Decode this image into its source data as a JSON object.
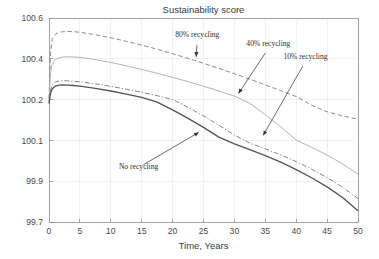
{
  "chart_data": {
    "type": "line",
    "title": "Sustainability score",
    "xlabel": "Time, Years",
    "ylabel": "",
    "grid": true,
    "legend_position": "inline-annotations",
    "xlim": [
      0,
      50
    ],
    "xticks": [
      0,
      5,
      10,
      15,
      20,
      25,
      30,
      35,
      40,
      45,
      50
    ],
    "xticklabels": [
      "0",
      "5",
      "10",
      "15",
      "20",
      "25",
      "30",
      "35",
      "40",
      "45",
      "50"
    ],
    "yticklabels": [
      "100.6",
      "100.4",
      "100.2",
      "100.1",
      "99.9",
      "99.7"
    ],
    "yticks": [
      100.6,
      100.4,
      100.2,
      100.1,
      99.9,
      99.7
    ],
    "y_axis_note": "tick labels are drawn at evenly spaced positions though the numeric gaps are uneven (0.2,0.2,0.1,0.2,0.2)",
    "x": [
      0,
      0.25,
      0.5,
      1,
      1.5,
      2,
      3,
      4,
      5,
      7.5,
      10,
      12.5,
      15,
      17.5,
      20,
      22.5,
      25,
      27.5,
      30,
      32.5,
      35,
      37.5,
      40,
      42.5,
      45,
      47.5,
      50
    ],
    "series": [
      {
        "name": "80% recycling",
        "style": "dashed",
        "color": "#8d8d8d",
        "width": 1.0,
        "values": [
          100.205,
          100.43,
          100.495,
          100.52,
          100.528,
          100.532,
          100.534,
          100.533,
          100.53,
          100.518,
          100.503,
          100.486,
          100.467,
          100.447,
          100.425,
          100.402,
          100.378,
          100.353,
          100.327,
          100.3,
          100.272,
          100.244,
          100.215,
          100.186,
          100.17,
          100.16,
          100.152
        ]
      },
      {
        "name": "40% recycling",
        "style": "solid",
        "color": "#b4b4b4",
        "width": 1.0,
        "values": [
          100.2,
          100.33,
          100.372,
          100.396,
          100.404,
          100.408,
          100.41,
          100.409,
          100.407,
          100.396,
          100.382,
          100.366,
          100.348,
          100.329,
          100.309,
          100.288,
          100.266,
          100.242,
          100.217,
          100.191,
          100.163,
          100.133,
          100.101,
          100.066,
          100.028,
          99.985,
          99.935
        ]
      },
      {
        "name": "10% recycling",
        "style": "dashdot",
        "color": "#7d7d7d",
        "width": 0.95,
        "values": [
          100.195,
          100.248,
          100.272,
          100.286,
          100.29,
          100.292,
          100.292,
          100.29,
          100.287,
          100.277,
          100.265,
          100.251,
          100.236,
          100.219,
          100.201,
          100.181,
          100.16,
          100.137,
          100.113,
          100.087,
          100.059,
          100.029,
          99.996,
          99.959,
          99.918,
          99.871,
          99.815
        ]
      },
      {
        "name": "No recycling",
        "style": "solid",
        "color": "#555555",
        "width": 1.35,
        "values": [
          100.19,
          100.23,
          100.252,
          100.266,
          100.27,
          100.272,
          100.271,
          100.269,
          100.266,
          100.255,
          100.242,
          100.227,
          100.211,
          100.194,
          100.175,
          100.154,
          100.132,
          100.108,
          100.083,
          100.055,
          100.025,
          99.993,
          99.957,
          99.917,
          99.872,
          99.82,
          99.755
        ]
      }
    ],
    "annotations": [
      {
        "text": "80% recycling",
        "label_x": 24.0,
        "label_y": 100.505,
        "target_x": 23.8,
        "target_y": 100.4
      },
      {
        "text": "40% recycling",
        "label_x": 35.5,
        "label_y": 100.462,
        "target_x": 30.5,
        "target_y": 100.222
      },
      {
        "text": "10% recycling",
        "label_x": 41.5,
        "label_y": 100.398,
        "target_x": 34.5,
        "target_y": 100.108
      },
      {
        "text": "No recycling",
        "label_x": 14.5,
        "label_y": 99.962,
        "target_x": 24.5,
        "target_y": 100.122
      }
    ]
  }
}
